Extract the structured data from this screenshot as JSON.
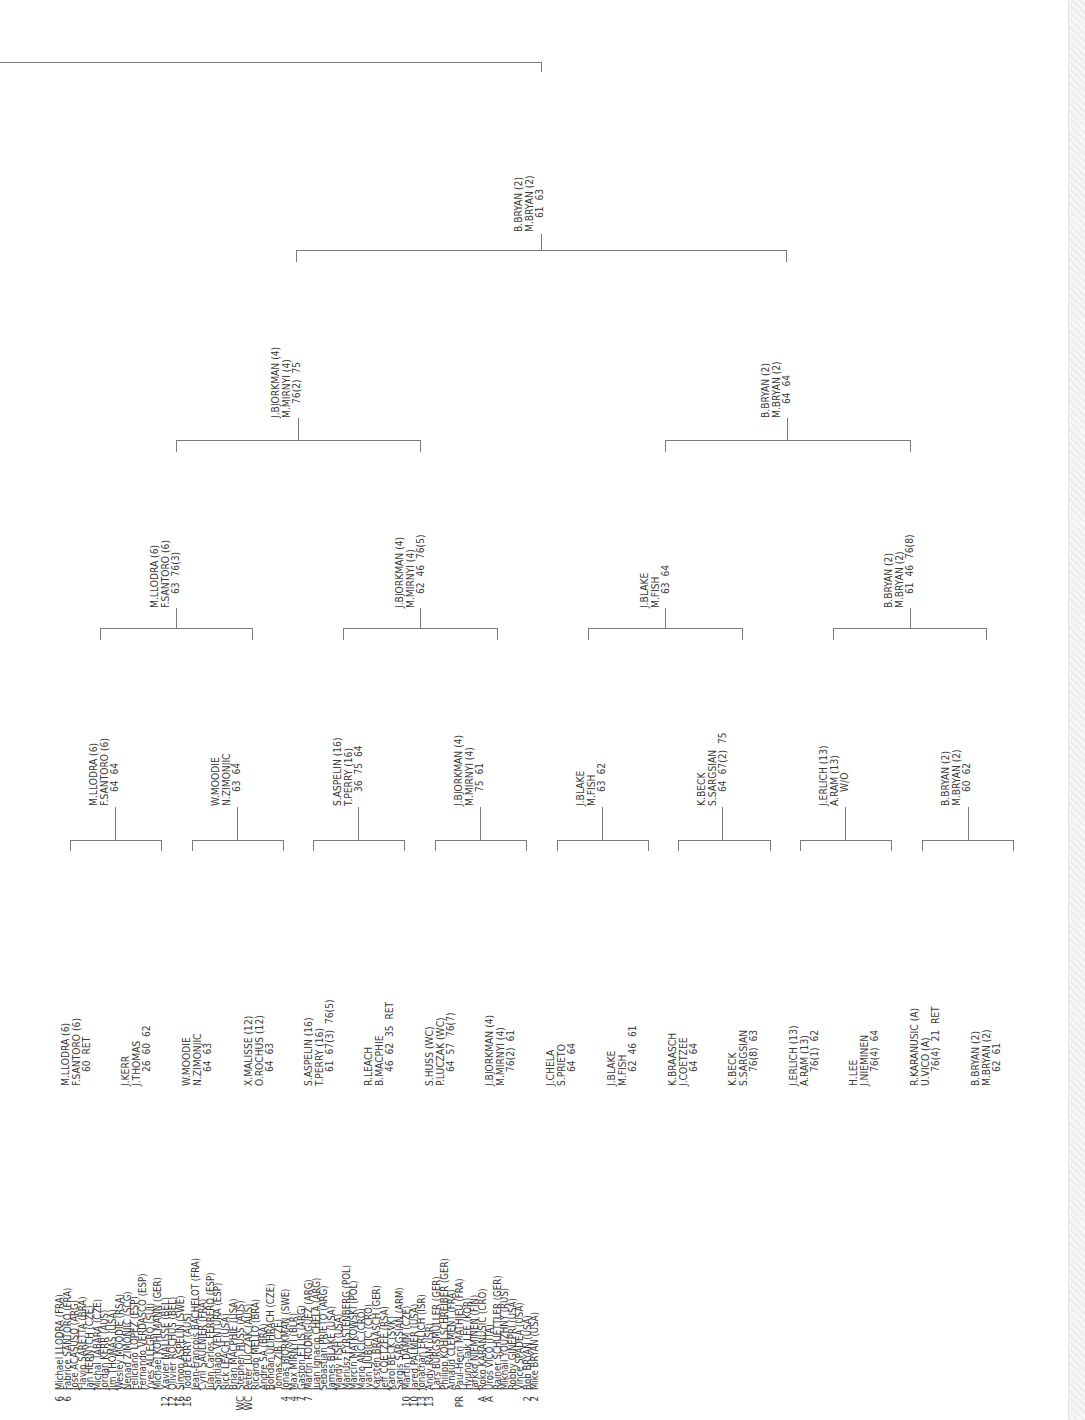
{
  "colors": {
    "text": "#3a3a3a",
    "lines": "#7a7a7a",
    "stripe": "#ececec"
  },
  "players": [
    {
      "seed": "6",
      "name": "Michael LLODRA (FRA)"
    },
    {
      "seed": "6",
      "name": "Fabrice SANTORO (FRA)"
    },
    {
      "seed": "",
      "name": "Jose ACASUSO (ARG)"
    },
    {
      "seed": "",
      "name": "Flavio SARETTA (BRA)"
    },
    {
      "seed": "",
      "name": "Jan HERNYCH (CZE)"
    },
    {
      "seed": "",
      "name": "Michal TABARA (CZE)"
    },
    {
      "seed": "",
      "name": "Jordan KERR (AUS)"
    },
    {
      "seed": "",
      "name": "Jim THOMAS (USA)"
    },
    {
      "seed": "",
      "name": "Wesley MOODIE (RSA)"
    },
    {
      "seed": "",
      "name": "Nenad ZIMONJIC (SCG)"
    },
    {
      "seed": "",
      "name": "Feliciano LOPEZ (ESP)"
    },
    {
      "seed": "",
      "name": "Fernando VERDASCO (ESP)"
    },
    {
      "seed": "",
      "name": "Yves ALLEGRO (SUI)"
    },
    {
      "seed": "",
      "name": "Michael KOHLMANN (GER)"
    },
    {
      "seed": "12",
      "name": "Xavier MALISSE (BEL)"
    },
    {
      "seed": "12",
      "name": "Olivier ROCHUS (BEL)"
    },
    {
      "seed": "16",
      "name": "Simon ASPELIN (SWE)"
    },
    {
      "seed": "16",
      "name": "Todd PERRY (AUS)"
    },
    {
      "seed": "",
      "name": "Jean-Francois BACHELOT (FRA)"
    },
    {
      "seed": "",
      "name": "Cyril SAULNIER (FRA)"
    },
    {
      "seed": "",
      "name": "Juan Carlos FERRERO (ESP)"
    },
    {
      "seed": "",
      "name": "Santiago VENTURA (ESP)"
    },
    {
      "seed": "",
      "name": "Rick LEACH (USA)"
    },
    {
      "seed": "",
      "name": "Brian MACPHIE (USA)"
    },
    {
      "seed": "WC",
      "name": "Stephen HUSS (AUS)"
    },
    {
      "seed": "WC",
      "name": "Peter LUCZAK (AUS)"
    },
    {
      "seed": "",
      "name": "Ricardo MELLO (BRA)"
    },
    {
      "seed": "",
      "name": "Andre SA (BRA)"
    },
    {
      "seed": "",
      "name": "Bohdan ULIHRACH (CZE)"
    },
    {
      "seed": "",
      "name": "Tomas ZIB (CZE)"
    },
    {
      "seed": "4",
      "name": "Jonas BJORKMAN (SWE)"
    },
    {
      "seed": "4",
      "name": "Max MIRNYI (BLR)"
    },
    {
      "seed": "7",
      "name": "Gaston ETLIS (ARG)"
    },
    {
      "seed": "7",
      "name": "Martin RODRIGUEZ (ARG)"
    },
    {
      "seed": "",
      "name": "Juan Ignacio CHELA (ARG)"
    },
    {
      "seed": "",
      "name": "Sebastian PRIETO (ARG)"
    },
    {
      "seed": "",
      "name": "James BLAKE (USA)"
    },
    {
      "seed": "",
      "name": "Mardy FISH (USA)"
    },
    {
      "seed": "",
      "name": "Mariusz FYRSTENBERG (POL)"
    },
    {
      "seed": "",
      "name": "Marcin MATKOWSKI (POL)"
    },
    {
      "seed": "",
      "name": "Mario ANCIC (CRO)"
    },
    {
      "seed": "",
      "name": "Ivan LJUBICIC (CRO)"
    },
    {
      "seed": "",
      "name": "Karsten BRAASCH (GER)"
    },
    {
      "seed": "",
      "name": "Jeff COETZEE (RSA)"
    },
    {
      "seed": "",
      "name": "Karol BECK (SVK)"
    },
    {
      "seed": "",
      "name": "Sargis SARGSIAN (ARM)"
    },
    {
      "seed": "10",
      "name": "Martin DAMM (CZE)"
    },
    {
      "seed": "10",
      "name": "Jared PALMER (USA)"
    },
    {
      "seed": "13",
      "name": "Jonathan ERLICH (ISR)"
    },
    {
      "seed": "13",
      "name": "Andy RAM (ISR)"
    },
    {
      "seed": "",
      "name": "Lars BURGSMULLER (GER)"
    },
    {
      "seed": "",
      "name": "Philipp KOHLSCHREIBER (GER)"
    },
    {
      "seed": "",
      "name": "Arnaud CLEMENT (FRA)"
    },
    {
      "seed": "PR",
      "name": "Paul-Henri MATHIEU (FRA)"
    },
    {
      "seed": "",
      "name": "Hyung-Taik LEE (KOR)"
    },
    {
      "seed": "",
      "name": "Jarkko NIEMINEN (FIN)"
    },
    {
      "seed": "A",
      "name": "Roko KARANUSIC (CRO)"
    },
    {
      "seed": "A",
      "name": "Uros VICO (ITA)"
    },
    {
      "seed": "",
      "name": "Rainer SCHUETTLER (GER)"
    },
    {
      "seed": "",
      "name": "Mikhail YOUZHNY (RUS)"
    },
    {
      "seed": "",
      "name": "Robby GINEPRI (USA)"
    },
    {
      "seed": "",
      "name": "Vince SPADEA (USA)"
    },
    {
      "seed": "2",
      "name": "Bob BRYAN (USA)"
    },
    {
      "seed": "2",
      "name": "Mike BRYAN (USA)"
    }
  ],
  "rounds": {
    "r1": [
      {
        "p1": "M.LLODRA (6)",
        "p2": "F.SANTORO (6)",
        "score": "60  RET"
      },
      {
        "p1": "J.KERR",
        "p2": "J.THOMAS",
        "score": "26  60  62"
      },
      {
        "p1": "W.MOODIE",
        "p2": "N.ZIMONJIC",
        "score": "64  63"
      },
      {
        "p1": "X.MALISSE (12)",
        "p2": "O.ROCHUS (12)",
        "score": "64  63"
      },
      {
        "p1": "S.ASPELIN (16)",
        "p2": "T.PERRY (16)",
        "score": "61  67(3)  76(5)"
      },
      {
        "p1": "R.LEACH",
        "p2": "B.MACPHIE",
        "score": "46  62  35  RET"
      },
      {
        "p1": "S.HUSS (WC)",
        "p2": "P.LUCZAK (WC)",
        "score": "64  57  76(7)"
      },
      {
        "p1": "J.BJORKMAN (4)",
        "p2": "M.MIRNYI (4)",
        "score": "76(2)  61"
      },
      {
        "p1": "J.CHELA",
        "p2": "S.PRIETO",
        "score": "64  64"
      },
      {
        "p1": "J.BLAKE",
        "p2": "M.FISH",
        "score": "62  46  61"
      },
      {
        "p1": "K.BRAASCH",
        "p2": "J.COETZEE",
        "score": "64  64"
      },
      {
        "p1": "K.BECK",
        "p2": "S.SARGSIAN",
        "score": "76(8)  63"
      },
      {
        "p1": "J.ERLICH (13)",
        "p2": "A.RAM (13)",
        "score": "76(1)  62"
      },
      {
        "p1": "H.LEE",
        "p2": "J.NIEMINEN",
        "score": "76(4)  64"
      },
      {
        "p1": "R.KARANUSIC (A)",
        "p2": "U.VICO (A)",
        "score": "76(4)  21  RET"
      },
      {
        "p1": "B.BRYAN (2)",
        "p2": "M.BRYAN (2)",
        "score": "62  61"
      }
    ],
    "r2": [
      {
        "p1": "M.LLODRA (6)",
        "p2": "F.SANTORO (6)",
        "score": "64  64"
      },
      {
        "p1": "W.MOODIE",
        "p2": "N.ZIMONJIC",
        "score": "63  64"
      },
      {
        "p1": "S.ASPELIN (16)",
        "p2": "T.PERRY (16)",
        "score": "36  75  64"
      },
      {
        "p1": "J.BJORKMAN (4)",
        "p2": "M.MIRNYI (4)",
        "score": "75  61"
      },
      {
        "p1": "J.BLAKE",
        "p2": "M.FISH",
        "score": "63  62"
      },
      {
        "p1": "K.BECK",
        "p2": "S.SARGSIAN",
        "score": "64  67(2)  75"
      },
      {
        "p1": "J.ERLICH (13)",
        "p2": "A.RAM (13)",
        "score": "W/O"
      },
      {
        "p1": "B.BRYAN (2)",
        "p2": "M.BRYAN (2)",
        "score": "60  62"
      }
    ],
    "qf": [
      {
        "p1": "M.LLODRA (6)",
        "p2": "F.SANTORO (6)",
        "score": "63  76(3)"
      },
      {
        "p1": "J.BJORKMAN (4)",
        "p2": "M.MIRNYI (4)",
        "score": "62  46  76(5)"
      },
      {
        "p1": "J.BLAKE",
        "p2": "M.FISH",
        "score": "63  64"
      },
      {
        "p1": "B.BRYAN (2)",
        "p2": "M.BRYAN (2)",
        "score": "61  46  76(8)"
      }
    ],
    "sf": [
      {
        "p1": "J.BJORKMAN (4)",
        "p2": "M.MIRNYI (4)",
        "score": "76(2)  75"
      },
      {
        "p1": "B.BRYAN (2)",
        "p2": "M.BRYAN (2)",
        "score": "64  64"
      }
    ],
    "final": [
      {
        "p1": "B.BRYAN (2)",
        "p2": "M.BRYAN (2)",
        "score": "61  63"
      }
    ]
  }
}
